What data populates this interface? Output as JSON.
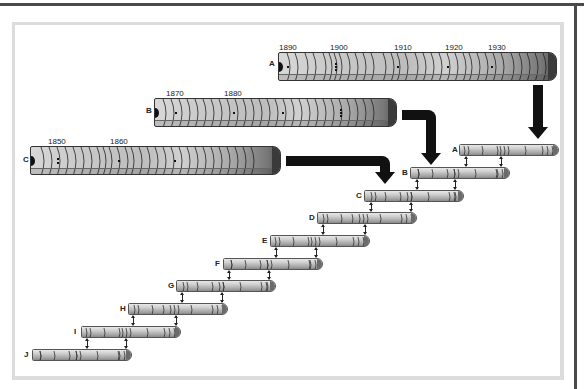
{
  "diagram": {
    "type": "dendrochronology-crossdating",
    "large_cores": [
      {
        "id": "A",
        "label": "A",
        "years": [
          "1890",
          "1900",
          "1910",
          "1920",
          "1930"
        ]
      },
      {
        "id": "B",
        "label": "B",
        "years": [
          "1870",
          "1880"
        ]
      },
      {
        "id": "C",
        "label": "C",
        "years": [
          "1850",
          "1860"
        ]
      }
    ],
    "small_cores": [
      {
        "id": "A",
        "label": "A"
      },
      {
        "id": "B",
        "label": "B"
      },
      {
        "id": "C",
        "label": "C"
      },
      {
        "id": "D",
        "label": "D"
      },
      {
        "id": "E",
        "label": "E"
      },
      {
        "id": "F",
        "label": "F"
      },
      {
        "id": "G",
        "label": "G"
      },
      {
        "id": "H",
        "label": "H"
      },
      {
        "id": "I",
        "label": "I"
      },
      {
        "id": "J",
        "label": "J"
      }
    ],
    "colors": {
      "arrow": "#111111",
      "frame": "#dcdcdc",
      "core_dark": "#3a3a3a"
    }
  }
}
